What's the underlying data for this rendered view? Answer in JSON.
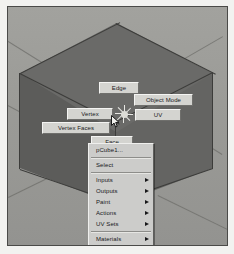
{
  "viewport": {
    "background_color": "#9a9a96",
    "object_name": "pCube1",
    "cube": {
      "top_face_color": "#6a6a68",
      "left_face_color": "#5c5c5a",
      "right_face_color": "#646462",
      "wireframe_color": "#3c3c3a"
    }
  },
  "marking_menu": {
    "gizmo_name": "marking-menu-gizmo",
    "items": [
      {
        "label": "Edge",
        "name": "marking-menu-edge",
        "left": 91,
        "top": 75,
        "width": 38
      },
      {
        "label": "Object Mode",
        "name": "marking-menu-object-mode",
        "left": 126,
        "top": 87,
        "width": 57
      },
      {
        "label": "UV",
        "name": "marking-menu-uv",
        "left": 127,
        "top": 102,
        "width": 44
      },
      {
        "label": "Vertex",
        "name": "marking-menu-vertex",
        "left": 59,
        "top": 101,
        "width": 44
      },
      {
        "label": "Vertex Faces",
        "name": "marking-menu-vertex-faces",
        "left": 34,
        "top": 115,
        "width": 66
      },
      {
        "label": "Face",
        "name": "marking-menu-face",
        "left": 83,
        "top": 129,
        "width": 40
      }
    ]
  },
  "context_menu": {
    "title": "pCube1...",
    "groups": [
      {
        "items": [
          {
            "label": "pCube1...",
            "name": "context-menu-item-pcube1",
            "submenu": false
          }
        ]
      },
      {
        "items": [
          {
            "label": "Select",
            "name": "context-menu-item-select",
            "submenu": false
          }
        ]
      },
      {
        "items": [
          {
            "label": "Inputs",
            "name": "context-menu-item-inputs",
            "submenu": true
          },
          {
            "label": "Outputs",
            "name": "context-menu-item-outputs",
            "submenu": true
          },
          {
            "label": "Paint",
            "name": "context-menu-item-paint",
            "submenu": true
          },
          {
            "label": "Actions",
            "name": "context-menu-item-actions",
            "submenu": true
          },
          {
            "label": "UV Sets",
            "name": "context-menu-item-uv-sets",
            "submenu": true
          }
        ]
      },
      {
        "items": [
          {
            "label": "Materials",
            "name": "context-menu-item-materials",
            "submenu": true
          },
          {
            "label": "Baking",
            "name": "context-menu-item-baking",
            "submenu": true
          }
        ]
      }
    ]
  },
  "colors": {
    "menu_face": "#ccccca",
    "menu_text": "#17171a",
    "label_face": "#d4d4d0"
  }
}
